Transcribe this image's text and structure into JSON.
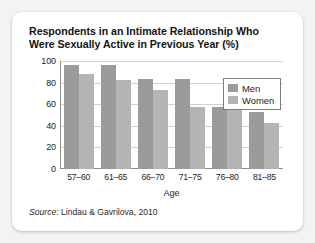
{
  "card": {
    "title": "Respondents in an Intimate Relationship Who Were Sexually Active in Previous Year (%)",
    "title_line1": "Respondents in an Intimate Relationship Who",
    "title_line2": "Were Sexually Active in Previous Year (%)",
    "source_prefix": "Source",
    "source_separator": ": ",
    "source_text": "Lindau & Gavrilova, 2010"
  },
  "legend": {
    "position": "top-right-inside",
    "items": [
      {
        "label": "Men",
        "color": "#9b9b9b",
        "swatch_name": "legend-swatch-men"
      },
      {
        "label": "Women",
        "color": "#b4b4b4",
        "swatch_name": "legend-swatch-women"
      }
    ]
  },
  "chart_data": {
    "type": "bar",
    "title": "Respondents in an Intimate Relationship Who Were Sexually Active in Previous Year (%)",
    "categories": [
      "57–60",
      "61–65",
      "66–70",
      "71–75",
      "76–80",
      "81–85"
    ],
    "series": [
      {
        "name": "Men",
        "color": "#9b9b9b",
        "values": [
          96,
          96,
          83,
          83,
          57,
          53
        ]
      },
      {
        "name": "Women",
        "color": "#b4b4b4",
        "values": [
          88,
          82,
          73,
          57,
          58,
          43
        ]
      }
    ],
    "xlabel": "Age",
    "ylabel": "",
    "ylim": [
      0,
      100
    ],
    "yticks": [
      0,
      20,
      40,
      60,
      80,
      100
    ],
    "ytick_labels": [
      "0",
      "20",
      "40",
      "60",
      "80",
      "100"
    ],
    "grid": true,
    "grid_axis": "y",
    "legend": true,
    "legend_position": "upper right",
    "source": "Source: Lindau & Gavrilova, 2010"
  }
}
